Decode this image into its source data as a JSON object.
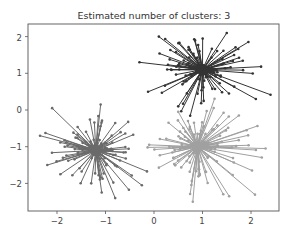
{
  "chart_data": {
    "type": "scatter",
    "title": "Estimated number of clusters: 3",
    "xlabel": "",
    "ylabel": "",
    "xlim": [
      -2.5,
      2.6
    ],
    "ylim": [
      -2.75,
      2.35
    ],
    "xticks": [
      -2,
      -1,
      0,
      1,
      2
    ],
    "yticks": [
      -2,
      -1,
      0,
      1,
      2
    ],
    "grid": false,
    "legend": null,
    "series": [
      {
        "name": "cluster-1",
        "color": "#333333",
        "center": [
          1.0,
          1.1
        ],
        "spread": 0.45,
        "count": 100,
        "seed": 7
      },
      {
        "name": "cluster-2",
        "color": "#6a6a6a",
        "center": [
          -1.2,
          -1.1
        ],
        "spread": 0.45,
        "count": 100,
        "seed": 13
      },
      {
        "name": "cluster-3",
        "color": "#a0a0a0",
        "center": [
          0.9,
          -1.0
        ],
        "spread": 0.5,
        "count": 100,
        "seed": 29
      }
    ],
    "extreme_points": {
      "cluster-1": [
        [
          -0.3,
          1.3
        ],
        [
          1.5,
          2.1
        ],
        [
          2.1,
          0.3
        ],
        [
          0.1,
          2.0
        ],
        [
          0.5,
          0.1
        ]
      ],
      "cluster-2": [
        [
          -2.35,
          -0.7
        ],
        [
          -2.1,
          0.05
        ],
        [
          -1.1,
          0.15
        ],
        [
          -0.8,
          -2.4
        ],
        [
          -2.2,
          -1.5
        ],
        [
          -0.25,
          -2.05
        ]
      ],
      "cluster-3": [
        [
          2.3,
          -1.05
        ],
        [
          0.8,
          -2.5
        ],
        [
          1.55,
          -2.35
        ],
        [
          -0.1,
          -0.95
        ],
        [
          1.75,
          -0.15
        ],
        [
          0.5,
          -0.05
        ]
      ]
    }
  },
  "labels": {
    "title": "Estimated number of clusters: 3",
    "xtick_labels": [
      "−2",
      "−1",
      "0",
      "1",
      "2"
    ],
    "ytick_labels": [
      "2",
      "1",
      "0",
      "−1",
      "−2"
    ]
  }
}
